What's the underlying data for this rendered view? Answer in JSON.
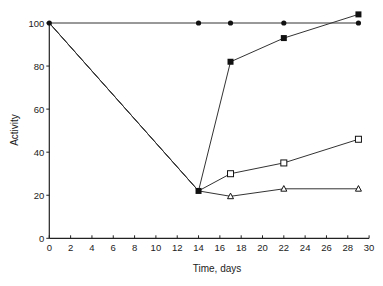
{
  "chart_data": {
    "type": "line",
    "title": "",
    "xlabel": "Time, days",
    "ylabel": "Activity",
    "xlim": [
      0,
      30
    ],
    "ylim": [
      0,
      100
    ],
    "x_ticks": [
      0,
      2,
      4,
      6,
      8,
      10,
      12,
      14,
      16,
      18,
      20,
      22,
      24,
      26,
      28,
      30
    ],
    "y_ticks": [
      0,
      20,
      40,
      60,
      80,
      100
    ],
    "grid": false,
    "legend": null,
    "series": [
      {
        "name": "filled circles",
        "marker": "filled-circle",
        "x": [
          0,
          14,
          17,
          22,
          29
        ],
        "y": [
          100,
          100,
          100,
          100,
          100
        ]
      },
      {
        "name": "filled squares",
        "marker": "filled-square",
        "x": [
          0,
          14,
          17,
          22,
          29
        ],
        "y": [
          100,
          22,
          82,
          93,
          104
        ]
      },
      {
        "name": "open squares",
        "marker": "open-square",
        "x": [
          0,
          14,
          17,
          22,
          29
        ],
        "y": [
          100,
          22,
          30,
          35,
          46
        ]
      },
      {
        "name": "open triangles",
        "marker": "open-triangle",
        "x": [
          0,
          14,
          17,
          22,
          29
        ],
        "y": [
          100,
          22,
          19.5,
          23,
          23
        ]
      }
    ]
  }
}
